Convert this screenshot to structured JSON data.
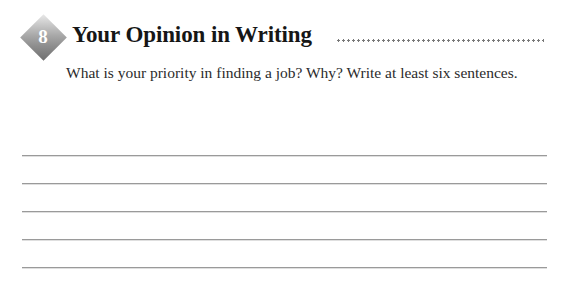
{
  "worksheet": {
    "section": {
      "number": "8",
      "title": "Your Opinion in Writing",
      "badge_icon": "diamond-badge-icon",
      "rule_icon": "dotted-rule-icon"
    },
    "prompt": "What is your priority in finding a job? Why? Write at least six sentences.",
    "answer_lines": [
      {
        "index": "1"
      },
      {
        "index": "2"
      },
      {
        "index": "3"
      },
      {
        "index": "4"
      },
      {
        "index": "5"
      }
    ],
    "colors": {
      "title_text": "#161616",
      "prompt_text": "#2b2b2b",
      "rule_dots": "#787878",
      "line_rule": "#9a9a9a",
      "badge_light": "#e9e9e9",
      "badge_dark": "#6f6f6f",
      "badge_number_text": "#ffffff",
      "page_background": "#ffffff"
    }
  }
}
